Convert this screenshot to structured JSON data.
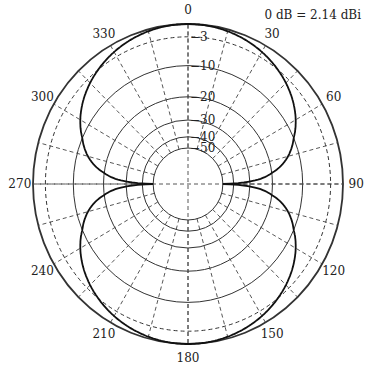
{
  "annotation": "0 dB = 2.14 dBi",
  "chart_data": {
    "type": "polar",
    "title": "",
    "annotation": "0 dB = 2.14 dBi",
    "angle_ticks": [
      0,
      30,
      60,
      90,
      120,
      150,
      180,
      210,
      240,
      270,
      300,
      330
    ],
    "spoke_step_deg": 15,
    "radial_ticks_db": [
      0,
      -3,
      -10,
      -20,
      -30,
      -40,
      -50
    ],
    "radial_tick_labels": [
      "-3",
      "-10",
      "-20",
      "-30",
      "-40",
      "-50"
    ],
    "radial_ring_styles": {
      "0": "solid",
      "-3": "dashed",
      "-10": "solid",
      "-20": "solid",
      "-30": "solid",
      "-40": "solid",
      "-50": "solid"
    },
    "rlim_db": [
      -50,
      0
    ],
    "series": [
      {
        "name": "dipole pattern",
        "angles_deg": [
          0,
          15,
          30,
          45,
          60,
          75,
          80,
          85,
          88,
          90,
          92,
          95,
          100,
          105,
          120,
          135,
          150,
          165,
          180,
          195,
          210,
          225,
          240,
          255,
          260,
          265,
          268,
          270,
          272,
          275,
          280,
          285,
          300,
          315,
          330,
          345
        ],
        "gain_db": [
          0,
          -0.2,
          -0.9,
          -2.2,
          -4.3,
          -8.5,
          -10.8,
          -16.2,
          -24.2,
          -50,
          -24.2,
          -16.2,
          -10.8,
          -8.5,
          -4.3,
          -2.2,
          -0.9,
          -0.2,
          0,
          -0.2,
          -0.9,
          -2.2,
          -4.3,
          -8.5,
          -10.8,
          -16.2,
          -24.2,
          -50,
          -24.2,
          -16.2,
          -10.8,
          -8.5,
          -4.3,
          -2.2,
          -0.9,
          -0.2
        ]
      }
    ]
  },
  "geometry": {
    "cx": 188,
    "cy": 184,
    "rx": 155,
    "ry": 160,
    "ring_radius_frac": {
      "0": 1.0,
      "-3": 0.92,
      "-10": 0.74,
      "-20": 0.545,
      "-30": 0.4,
      "-40": 0.295,
      "-50": 0.225
    }
  }
}
